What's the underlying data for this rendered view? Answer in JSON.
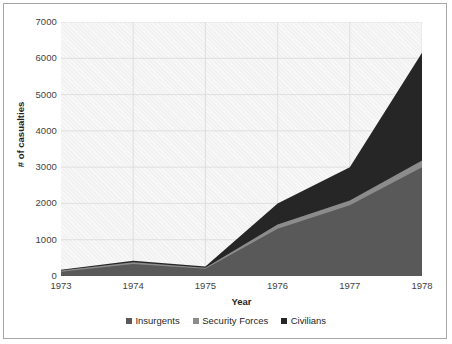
{
  "chart_data": {
    "type": "area",
    "stacked": true,
    "title": "",
    "xlabel": "Year",
    "ylabel": "# of casualties",
    "categories": [
      "1973",
      "1974",
      "1975",
      "1976",
      "1977",
      "1978"
    ],
    "x": [
      1973,
      1974,
      1975,
      1976,
      1977,
      1978
    ],
    "xlim": [
      1973,
      1978
    ],
    "ylim": [
      0,
      7000
    ],
    "ytick_labels": [
      "7000",
      "6000",
      "5000",
      "4000",
      "3000",
      "2000",
      "1000",
      "0"
    ],
    "ytick_values": [
      7000,
      6000,
      5000,
      4000,
      3000,
      2000,
      1000,
      0
    ],
    "grid": "vertical-and-horizontal-light",
    "legend_position": "bottom",
    "series": [
      {
        "name": "Insurgents",
        "color": "#595959",
        "values": [
          120,
          330,
          200,
          1300,
          1950,
          3000
        ]
      },
      {
        "name": "Security Forces",
        "color": "#8c8c8c",
        "values": [
          30,
          50,
          30,
          120,
          130,
          180
        ]
      },
      {
        "name": "Civilians",
        "color": "#262626",
        "values": [
          20,
          40,
          30,
          580,
          920,
          2970
        ]
      }
    ],
    "totals": [
      170,
      420,
      260,
      2000,
      3000,
      6150
    ]
  },
  "legend": {
    "items": [
      {
        "label": "Insurgents",
        "color": "#595959"
      },
      {
        "label": "Security Forces",
        "color": "#8c8c8c"
      },
      {
        "label": "Civilians",
        "color": "#262626"
      }
    ]
  },
  "axes": {
    "y_title": "# of casualties",
    "x_title": "Year"
  },
  "colors": {
    "plot_background": "#f2f2f2",
    "frame_border": "#a6a6a6",
    "gridline": "#d9d9d9",
    "axis_text": "#3f3f3f",
    "title_text": "#1f1f1f"
  }
}
